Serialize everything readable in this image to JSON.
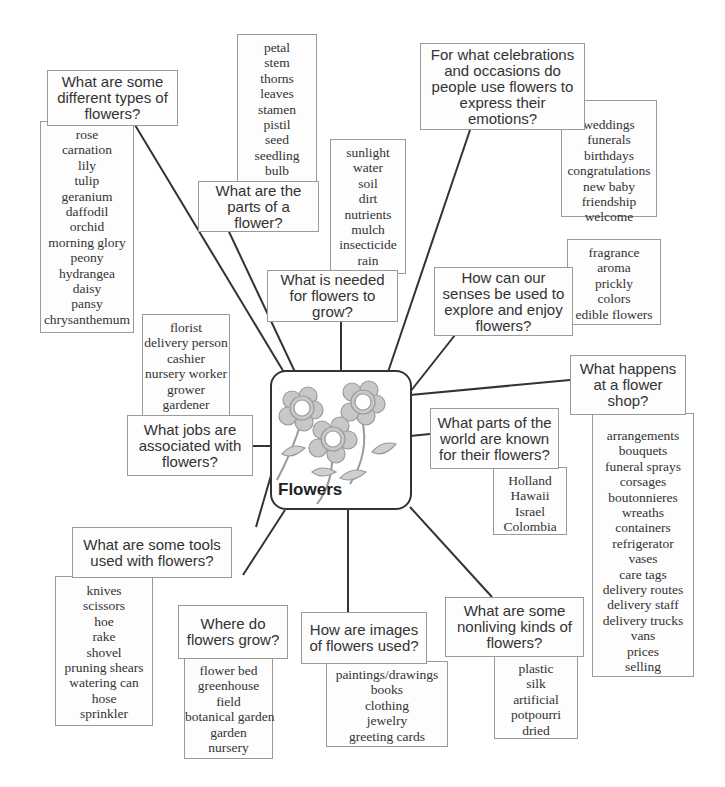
{
  "center": {
    "title": "Flowers",
    "icon": "flowers-illustration-icon"
  },
  "branches": [
    {
      "id": "types",
      "question": "What are some different types of flowers?",
      "items": [
        "rose",
        "carnation",
        "lily",
        "tulip",
        "geranium",
        "daffodil",
        "orchid",
        "morning glory",
        "peony",
        "hydrangea",
        "daisy",
        "pansy",
        "chrysanthemum"
      ]
    },
    {
      "id": "parts",
      "question": "What are the parts of a flower?",
      "items": [
        "petal",
        "stem",
        "thorns",
        "leaves",
        "stamen",
        "pistil",
        "seed",
        "seedling",
        "bulb"
      ]
    },
    {
      "id": "needs",
      "question": "What is needed for flowers to grow?",
      "items": [
        "sunlight",
        "water",
        "soil",
        "dirt",
        "nutrients",
        "mulch",
        "insecticide",
        "rain"
      ]
    },
    {
      "id": "celebrations",
      "question": "For what celebrations and occasions do people use flowers to express their emotions?",
      "items": [
        "weddings",
        "funerals",
        "birthdays",
        "congratulations",
        "new baby",
        "friendship",
        "welcome"
      ]
    },
    {
      "id": "senses",
      "question": "How can our senses be used to explore and enjoy flowers?",
      "items": [
        "fragrance",
        "aroma",
        "prickly",
        "colors",
        "edible flowers"
      ]
    },
    {
      "id": "shop",
      "question": "What happens at a flower shop?",
      "items": [
        "arrangements",
        "bouquets",
        "funeral sprays",
        "corsages",
        "boutonnieres",
        "wreaths",
        "containers",
        "refrigerator",
        "vases",
        "care tags",
        "delivery routes",
        "delivery staff",
        "delivery trucks",
        "vans",
        "prices",
        "selling"
      ]
    },
    {
      "id": "world",
      "question": "What parts of the world are known for their flowers?",
      "items": [
        "Holland",
        "Hawaii",
        "Israel",
        "Colombia"
      ]
    },
    {
      "id": "jobs",
      "question": "What jobs are associated with flowers?",
      "items": [
        "florist",
        "delivery person",
        "cashier",
        "nursery worker",
        "grower",
        "gardener"
      ]
    },
    {
      "id": "tools",
      "question": "What are some tools used with flowers?",
      "items": [
        "knives",
        "scissors",
        "hoe",
        "rake",
        "shovel",
        "pruning shears",
        "watering can",
        "hose",
        "sprinkler"
      ]
    },
    {
      "id": "where",
      "question": "Where do flowers grow?",
      "items": [
        "flower bed",
        "greenhouse",
        "field",
        "botanical garden",
        "garden",
        "nursery"
      ]
    },
    {
      "id": "images",
      "question": "How are images of flowers used?",
      "items": [
        "paintings/drawings",
        "books",
        "clothing",
        "jewelry",
        "greeting cards"
      ]
    },
    {
      "id": "nonliving",
      "question": "What are some nonliving kinds of flowers?",
      "items": [
        "plastic",
        "silk",
        "artificial",
        "potpourri",
        "dried"
      ]
    }
  ],
  "colors": {
    "line": "#333333",
    "box_border": "#9a9a9a",
    "petal_fill": "#c8c8c8",
    "petal_stroke": "#9a9a9a"
  }
}
